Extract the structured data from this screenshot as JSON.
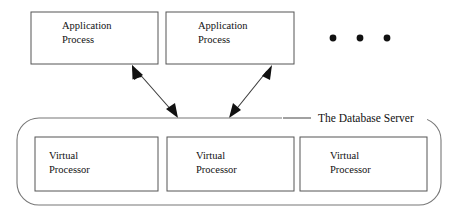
{
  "diagram": {
    "background_color": "#ffffff",
    "box_stroke_color": "#555555",
    "box_fill_color": "#ffffff",
    "arrow_color": "#111111",
    "text_color": "#111111"
  },
  "application_processes": [
    {
      "id": "application-process-1",
      "line1": "Application",
      "line2": "Process",
      "x": 31,
      "y": 12,
      "width": 127,
      "height": 52
    },
    {
      "id": "application-process-2",
      "line1": "Application",
      "line2": "Process",
      "x": 166,
      "y": 12,
      "width": 128,
      "height": 52
    }
  ],
  "ellipsis": {
    "label": "more application processes",
    "dots": 3,
    "cx": [
      333,
      360,
      387
    ],
    "cy": 38,
    "r": 3.4
  },
  "server": {
    "label": "The Database Server",
    "label_x": 318,
    "label_y": 121,
    "leader_line": {
      "x1": 283,
      "y1": 118,
      "x2": 311,
      "y2": 118
    },
    "outline": {
      "x": 17,
      "y": 118,
      "width": 424,
      "height": 87,
      "rx": 22
    }
  },
  "virtual_processors": [
    {
      "id": "virtual-processor-1",
      "line1": "Virtual",
      "line2": "Processor",
      "x": 35,
      "y": 137,
      "width": 123,
      "height": 54
    },
    {
      "id": "virtual-processor-2",
      "line1": "Virtual",
      "line2": "Processor",
      "x": 167,
      "y": 137,
      "width": 127,
      "height": 54
    },
    {
      "id": "virtual-processor-3",
      "line1": "Virtual",
      "line2": "Processor",
      "x": 300,
      "y": 137,
      "width": 127,
      "height": 54
    }
  ],
  "connections": [
    {
      "id": "connection-ap1-to-server",
      "from": "application-process-1",
      "to": "the-database-server",
      "double_headed": true,
      "x1": 133,
      "y1": 66,
      "x2": 177,
      "y2": 117
    },
    {
      "id": "connection-ap2-to-server",
      "from": "application-process-2",
      "to": "the-database-server",
      "double_headed": true,
      "x1": 271,
      "y1": 66,
      "x2": 230,
      "y2": 117
    }
  ]
}
